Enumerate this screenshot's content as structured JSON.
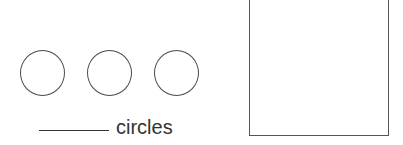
{
  "worksheet": {
    "circles": [
      {
        "id": 1
      },
      {
        "id": 2
      },
      {
        "id": 3
      }
    ],
    "answer_blank": "",
    "label": "circles",
    "drawing_box": {
      "content": ""
    },
    "colors": {
      "stroke": "#4a4a4a",
      "text": "#333333",
      "background": "#ffffff"
    }
  }
}
